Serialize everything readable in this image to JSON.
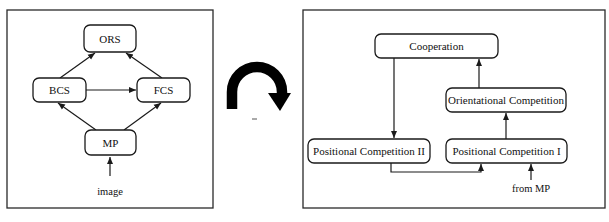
{
  "left_panel": {
    "nodes": {
      "ors": {
        "label": "ORS"
      },
      "bcs": {
        "label": "BCS"
      },
      "fcs": {
        "label": "FCS"
      },
      "mp": {
        "label": "MP"
      }
    },
    "input_label": "image",
    "edges": [
      {
        "from": "image",
        "to": "MP"
      },
      {
        "from": "MP",
        "to": "BCS"
      },
      {
        "from": "MP",
        "to": "FCS"
      },
      {
        "from": "BCS",
        "to": "FCS"
      },
      {
        "from": "BCS",
        "to": "ORS"
      },
      {
        "from": "FCS",
        "to": "ORS"
      }
    ]
  },
  "transition_icon": "curved-arrow-clockwise",
  "right_panel": {
    "nodes": {
      "cooperation": {
        "label": "Cooperation"
      },
      "orientational": {
        "label": "Orientational Competition"
      },
      "positional_2": {
        "label": "Positional Competition II"
      },
      "positional_1": {
        "label": "Positional Competition I"
      }
    },
    "input_label": "from MP",
    "edges": [
      {
        "from": "from MP",
        "to": "Positional Competition I"
      },
      {
        "from": "Positional Competition I",
        "to": "Orientational Competition"
      },
      {
        "from": "Orientational Competition",
        "to": "Cooperation"
      },
      {
        "from": "Cooperation",
        "to": "Positional Competition II"
      },
      {
        "from": "Positional Competition II",
        "to": "Positional Competition I"
      }
    ]
  },
  "colors": {
    "stroke": "#1a1a1a",
    "background": "#ffffff"
  }
}
